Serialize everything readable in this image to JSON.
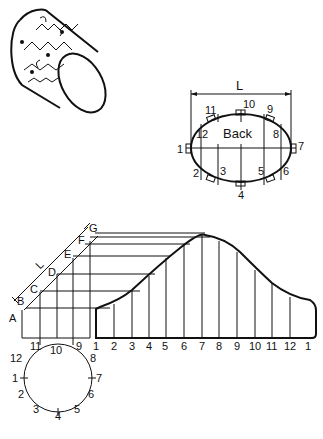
{
  "figure": {
    "iso_view": {
      "label": "isometric-decorated-cylinder"
    },
    "ellipse_view": {
      "title": "Back",
      "dimension_label": "L",
      "points": [
        "1",
        "2",
        "3",
        "4",
        "5",
        "6",
        "7",
        "8",
        "9",
        "10",
        "11",
        "12"
      ]
    },
    "side_view": {
      "letters": [
        "A",
        "B",
        "C",
        "D",
        "E",
        "F",
        "G"
      ],
      "dimension_label": "L",
      "bottom_labels": [
        "11",
        "10",
        "9"
      ]
    },
    "circle_view": {
      "points": [
        "1",
        "2",
        "3",
        "4",
        "5",
        "6",
        "7",
        "8",
        "9",
        "10",
        "11",
        "12"
      ]
    },
    "development": {
      "x_labels": [
        "1",
        "2",
        "3",
        "4",
        "5",
        "6",
        "7",
        "8",
        "9",
        "10",
        "11",
        "12",
        "1"
      ]
    }
  },
  "colors": {
    "ink": "#111111",
    "fill": "#bdbdbd",
    "background": "#ffffff"
  }
}
